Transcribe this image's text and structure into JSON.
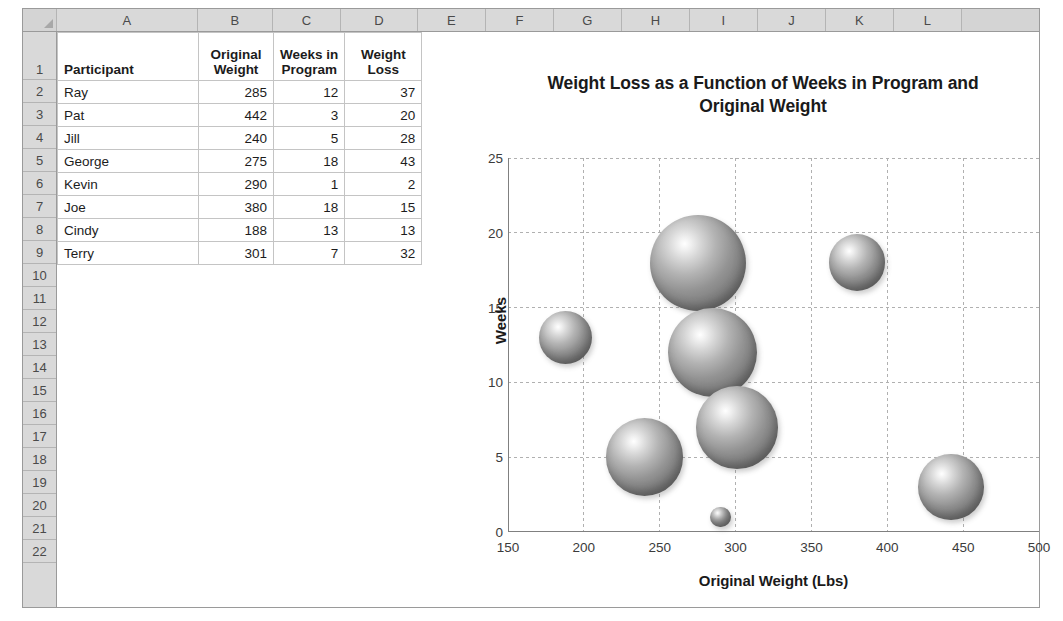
{
  "app": "excel-worksheet-with-bubble-chart",
  "sheet": {
    "column_letters": [
      "A",
      "B",
      "C",
      "D",
      "E",
      "F",
      "G",
      "H",
      "I",
      "J",
      "K",
      "L"
    ],
    "row_numbers": [
      "1",
      "2",
      "3",
      "4",
      "5",
      "6",
      "7",
      "8",
      "9",
      "10",
      "11",
      "12",
      "13",
      "14",
      "15",
      "16",
      "17",
      "18",
      "19",
      "20",
      "21",
      "22"
    ],
    "corner_select_all": "select-all"
  },
  "table": {
    "headers": {
      "participant": "Participant",
      "original_weight_line1": "Original",
      "original_weight_line2": "Weight",
      "weeks_line1": "Weeks in",
      "weeks_line2": "Program",
      "loss_line1": "Weight",
      "loss_line2": "Loss"
    },
    "rows": [
      {
        "row": "2",
        "participant": "Ray",
        "original_weight": "285",
        "weeks_in_program": "12",
        "weight_loss": "37"
      },
      {
        "row": "3",
        "participant": "Pat",
        "original_weight": "442",
        "weeks_in_program": "3",
        "weight_loss": "20"
      },
      {
        "row": "4",
        "participant": "Jill",
        "original_weight": "240",
        "weeks_in_program": "5",
        "weight_loss": "28"
      },
      {
        "row": "5",
        "participant": "George",
        "original_weight": "275",
        "weeks_in_program": "18",
        "weight_loss": "43"
      },
      {
        "row": "6",
        "participant": "Kevin",
        "original_weight": "290",
        "weeks_in_program": "1",
        "weight_loss": "2"
      },
      {
        "row": "7",
        "participant": "Joe",
        "original_weight": "380",
        "weeks_in_program": "18",
        "weight_loss": "15"
      },
      {
        "row": "8",
        "participant": "Cindy",
        "original_weight": "188",
        "weeks_in_program": "13",
        "weight_loss": "13"
      },
      {
        "row": "9",
        "participant": "Terry",
        "original_weight": "301",
        "weeks_in_program": "7",
        "weight_loss": "32"
      }
    ]
  },
  "chart_data": {
    "type": "scatter",
    "subtype": "bubble",
    "title": "Weight Loss as a Function of Weeks in Program and Original Weight",
    "title_line1": "Weight Loss as a Function of Weeks in Program and",
    "title_line2": "Original Weight",
    "xlabel": "Original Weight (Lbs)",
    "ylabel": "Weeks",
    "xlim": [
      150,
      500
    ],
    "ylim": [
      0,
      25
    ],
    "xticks": [
      150,
      200,
      250,
      300,
      350,
      400,
      450,
      500
    ],
    "yticks": [
      0,
      5,
      10,
      15,
      20,
      25
    ],
    "grid": true,
    "grid_style": "dashed",
    "legend": "none",
    "size_field": "Weight Loss",
    "bubble_style": "3d-sphere-gray",
    "colors": {
      "bubble_base": "#8f8f8f",
      "bubble_highlight": "#ffffff",
      "bubble_shadow": "#4a4a4a",
      "grid": "#b0b0b0",
      "axis": "#808080",
      "text": "#1a1a1a",
      "header_fill": "#d9d9d9"
    },
    "points": [
      {
        "label": "Ray",
        "x": 285,
        "y": 12,
        "size": 37
      },
      {
        "label": "Pat",
        "x": 442,
        "y": 3,
        "size": 20
      },
      {
        "label": "Jill",
        "x": 240,
        "y": 5,
        "size": 28
      },
      {
        "label": "George",
        "x": 275,
        "y": 18,
        "size": 43
      },
      {
        "label": "Kevin",
        "x": 290,
        "y": 1,
        "size": 2
      },
      {
        "label": "Joe",
        "x": 380,
        "y": 18,
        "size": 15
      },
      {
        "label": "Cindy",
        "x": 188,
        "y": 13,
        "size": 13
      },
      {
        "label": "Terry",
        "x": 301,
        "y": 7,
        "size": 32
      }
    ]
  }
}
